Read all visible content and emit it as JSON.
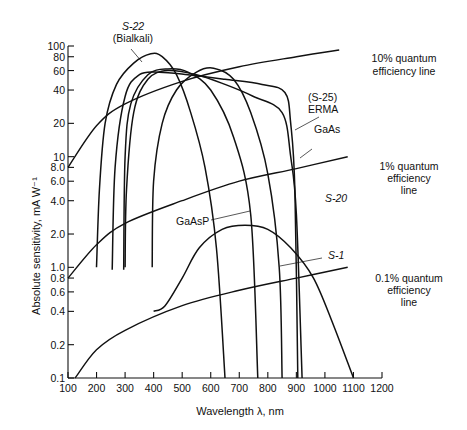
{
  "chart_data": {
    "type": "line",
    "title": "",
    "xlabel": "Wavelength λ, nm",
    "ylabel": "Absolute sensitivity, mA W⁻¹",
    "xlim": [
      100,
      1200
    ],
    "ylim": [
      0.1,
      100
    ],
    "yscale": "log",
    "grid": false,
    "x_ticks": [
      "100",
      "200",
      "300",
      "400",
      "500",
      "600",
      "700",
      "800",
      "900",
      "1000",
      "1100",
      "1200"
    ],
    "y_ticks": [
      "100",
      "80",
      "60",
      "40",
      "20",
      "10",
      "8.0",
      "6.0",
      "4.0",
      "2.0",
      "1.0",
      "0.8",
      "0.6",
      "0.4",
      "0.2",
      "0.1"
    ],
    "y_tick_values": [
      100,
      80,
      60,
      40,
      20,
      10,
      8,
      6,
      4,
      2,
      1,
      0.8,
      0.6,
      0.4,
      0.2,
      0.1
    ],
    "series": [
      {
        "name": "S-22 (Bialkali)",
        "points": [
          [
            200,
            1.0
          ],
          [
            210,
            5
          ],
          [
            230,
            20
          ],
          [
            270,
            45
          ],
          [
            330,
            70
          ],
          [
            390,
            85
          ],
          [
            430,
            80
          ],
          [
            480,
            55
          ],
          [
            530,
            25
          ],
          [
            580,
            8
          ],
          [
            620,
            1.5
          ],
          [
            650,
            0.1
          ]
        ]
      },
      {
        "name": "(S-25) ERMA",
        "points": [
          [
            255,
            0.95
          ],
          [
            265,
            8
          ],
          [
            300,
            35
          ],
          [
            350,
            55
          ],
          [
            420,
            58
          ],
          [
            520,
            55
          ],
          [
            650,
            50
          ],
          [
            780,
            45
          ],
          [
            860,
            38
          ],
          [
            880,
            20
          ],
          [
            895,
            5
          ],
          [
            905,
            0.1
          ]
        ]
      },
      {
        "name": "GaAs",
        "points": [
          [
            300,
            1.0
          ],
          [
            305,
            5
          ],
          [
            330,
            25
          ],
          [
            380,
            50
          ],
          [
            450,
            60
          ],
          [
            550,
            55
          ],
          [
            650,
            45
          ],
          [
            750,
            35
          ],
          [
            850,
            25
          ],
          [
            880,
            10
          ],
          [
            900,
            3
          ],
          [
            920,
            0.1
          ]
        ]
      },
      {
        "name": "S-20",
        "points": [
          [
            295,
            0.95
          ],
          [
            300,
            10
          ],
          [
            320,
            30
          ],
          [
            380,
            55
          ],
          [
            450,
            62
          ],
          [
            520,
            58
          ],
          [
            600,
            40
          ],
          [
            680,
            15
          ],
          [
            740,
            3
          ],
          [
            765,
            0.1
          ]
        ]
      },
      {
        "name": "GaAsP",
        "points": [
          [
            395,
            1.0
          ],
          [
            400,
            6
          ],
          [
            430,
            20
          ],
          [
            480,
            40
          ],
          [
            550,
            58
          ],
          [
            610,
            63
          ],
          [
            680,
            50
          ],
          [
            740,
            25
          ],
          [
            800,
            7
          ],
          [
            840,
            1
          ],
          [
            850,
            0.1
          ]
        ]
      },
      {
        "name": "S-1",
        "points": [
          [
            400,
            0.4
          ],
          [
            440,
            0.45
          ],
          [
            500,
            0.8
          ],
          [
            560,
            1.5
          ],
          [
            640,
            2.2
          ],
          [
            720,
            2.4
          ],
          [
            800,
            2.2
          ],
          [
            880,
            1.5
          ],
          [
            960,
            0.8
          ],
          [
            1030,
            0.3
          ],
          [
            1100,
            0.1
          ]
        ]
      },
      {
        "name": "10% quantum efficiency line",
        "style": "reference",
        "points": [
          [
            100,
            8.0
          ],
          [
            200,
            19
          ],
          [
            300,
            30
          ],
          [
            500,
            48
          ],
          [
            700,
            65
          ],
          [
            900,
            80
          ],
          [
            1050,
            92
          ]
        ]
      },
      {
        "name": "1% quantum efficiency line",
        "style": "reference",
        "points": [
          [
            100,
            0.8
          ],
          [
            200,
            1.6
          ],
          [
            300,
            2.5
          ],
          [
            500,
            4.0
          ],
          [
            700,
            6.0
          ],
          [
            900,
            7.8
          ],
          [
            1080,
            10
          ]
        ]
      },
      {
        "name": "0.1% quantum efficiency line",
        "style": "reference",
        "points": [
          [
            125,
            0.1
          ],
          [
            200,
            0.18
          ],
          [
            300,
            0.27
          ],
          [
            500,
            0.45
          ],
          [
            700,
            0.62
          ],
          [
            900,
            0.8
          ],
          [
            1080,
            1.0
          ]
        ]
      }
    ],
    "annotations": [
      {
        "text": "S-22 (Bialkali)",
        "target": "S-22 peak ~390 nm"
      },
      {
        "text": "10% quantum efficiency line"
      },
      {
        "text": "(S-25) ERMA"
      },
      {
        "text": "GaAs"
      },
      {
        "text": "1% quantum efficiency line"
      },
      {
        "text": "S-20"
      },
      {
        "text": "GaAsP"
      },
      {
        "text": "S-1"
      },
      {
        "text": "0.1% quantum efficiency line"
      }
    ],
    "legend": "none (inline labels)"
  },
  "labels": {
    "s22_a": "S-22",
    "s22_b": "(Bialkali)",
    "qe10_a": "10% quantum",
    "qe10_b": "efficiency line",
    "s25_a": "(S-25)",
    "s25_b": "ERMA",
    "gaas": "GaAs",
    "qe1_a": "1% quantum",
    "qe1_b": "efficiency",
    "qe1_c": "line",
    "s20": "S-20",
    "gaasp": "GaAsP",
    "s1": "S-1",
    "qe01_a": "0.1% quantum",
    "qe01_b": "efficiency",
    "qe01_c": "line"
  }
}
